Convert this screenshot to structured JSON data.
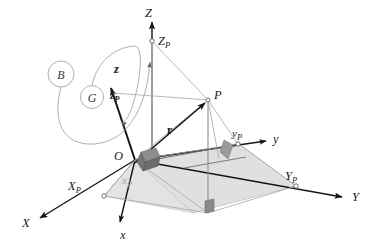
{
  "figure": {
    "background_color": "#ffffff"
  },
  "colors": {
    "axis_dark": "#1a1a1a",
    "axis_gray": "#9a9a9a",
    "plane_fill": "#dcdcdc",
    "plane_fill_light": "#e8e8e8",
    "right_angle_fill": "#8e8e8e",
    "right_angle_fill_dark": "#6f6f6f",
    "label_gray": "#a8a8a8",
    "curve_gray": "#8c8c8c"
  },
  "global_frame": {
    "name": "global-frame",
    "axes": [
      {
        "name": "axis-X",
        "label": "X",
        "arrow": true
      },
      {
        "name": "axis-Y",
        "label": "Y",
        "arrow": true
      },
      {
        "name": "axis-Z",
        "label": "Z",
        "arrow": true
      }
    ],
    "origin_label": "O"
  },
  "local_frame": {
    "name": "local-frame",
    "axes": [
      {
        "name": "axis-x",
        "label": "x",
        "arrow": true
      },
      {
        "name": "axis-y",
        "label": "y",
        "arrow": true
      },
      {
        "name": "axis-z",
        "label": "z",
        "arrow": true,
        "bold": true
      }
    ]
  },
  "point": {
    "label": "P",
    "vector_label": "r"
  },
  "projections_global": [
    {
      "name": "projection-XP",
      "label": "X",
      "subscript": "P"
    },
    {
      "name": "projection-YP",
      "label": "Y",
      "subscript": "P"
    },
    {
      "name": "projection-ZP",
      "label": "Z",
      "subscript": "P"
    }
  ],
  "projections_local": [
    {
      "name": "projection-xp",
      "label": "x",
      "subscript": "p",
      "gray": true
    },
    {
      "name": "projection-yp",
      "label": "y",
      "subscript": "p",
      "gray": false
    },
    {
      "name": "projection-zp",
      "label": "z",
      "subscript": "p",
      "gray": false
    }
  ],
  "set_markers": [
    {
      "name": "set-marker-B",
      "label": "B"
    },
    {
      "name": "set-marker-G",
      "label": "G"
    }
  ],
  "labels": {
    "Z": "Z",
    "Y": "Y",
    "X": "X",
    "z": "z",
    "y": "y",
    "x": "x",
    "O": "O",
    "P": "P",
    "r": "r",
    "ZP": "Z",
    "ZP_sub": "P",
    "YP": "Y",
    "YP_sub": "P",
    "XP": "X",
    "XP_sub": "P",
    "zp": "z",
    "zp_sub": "P",
    "yp": "y",
    "yp_sub": "P",
    "xp": "x",
    "xp_sub": "P",
    "B": "B",
    "G": "G"
  }
}
